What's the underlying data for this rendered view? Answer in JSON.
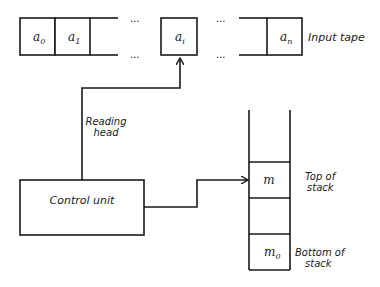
{
  "diagram": {
    "type": "pushdown-automaton",
    "input_tape": {
      "label": "Input tape",
      "cells": [
        {
          "symbol": "a",
          "subscript": "0"
        },
        {
          "symbol": "a",
          "subscript": "1"
        },
        {
          "symbol": "a",
          "subscript": "i"
        },
        {
          "symbol": "a",
          "subscript": "n"
        }
      ],
      "ellipsis": "..."
    },
    "reading_head": {
      "label_line1": "Reading",
      "label_line2": "head"
    },
    "control_unit": {
      "label": "Control unit"
    },
    "stack": {
      "cells": [
        {
          "symbol": "m",
          "subscript": ""
        },
        {
          "symbol": "",
          "subscript": ""
        },
        {
          "symbol": "m",
          "subscript": "0"
        }
      ],
      "top_label_line1": "Top of",
      "top_label_line2": "stack",
      "bottom_label_line1": "Bottom of",
      "bottom_label_line2": "stack"
    }
  }
}
